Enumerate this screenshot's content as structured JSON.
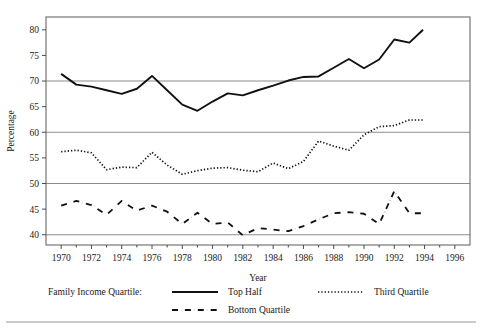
{
  "chart_data": {
    "type": "line",
    "title": "",
    "xlabel": "Year",
    "ylabel": "Percentage",
    "xlim": [
      1969,
      1997
    ],
    "ylim": [
      38,
      82.5
    ],
    "xticks": [
      1970,
      1972,
      1974,
      1976,
      1978,
      1980,
      1982,
      1984,
      1986,
      1988,
      1990,
      1992,
      1994,
      1996
    ],
    "xtick_labels": [
      "1970",
      "1972",
      "1974",
      "1976",
      "1978",
      "1980",
      "1982",
      "1984",
      "1986",
      "1988",
      "1990",
      "1992",
      "1994",
      "1996"
    ],
    "xminor_ticks": [
      1971,
      1973,
      1975,
      1977,
      1979,
      1981,
      1983,
      1985,
      1987,
      1989,
      1991,
      1993,
      1995
    ],
    "yticks": [
      40,
      45,
      50,
      55,
      60,
      65,
      70,
      75,
      80
    ],
    "ytick_labels": [
      "40",
      "45",
      "50",
      "55",
      "60",
      "65",
      "70",
      "75",
      "80"
    ],
    "gridlines_y": [
      40,
      50,
      60,
      70
    ],
    "grid": true,
    "legend_position": "below-axis",
    "legend_title": "Family Income Quartile:",
    "x": [
      1970,
      1971,
      1972,
      1973,
      1974,
      1975,
      1976,
      1977,
      1978,
      1979,
      1980,
      1981,
      1982,
      1983,
      1984,
      1985,
      1986,
      1987,
      1988,
      1989,
      1990,
      1991,
      1992,
      1993
    ],
    "series": [
      {
        "name": "Top Half",
        "style": "solid",
        "color": "#111111",
        "width": 1.9,
        "values": [
          71.4,
          69.3,
          68.9,
          68.2,
          67.5,
          68.5,
          71.0,
          68.2,
          65.4,
          64.2,
          66.0,
          67.6,
          67.2,
          68.2,
          69.1,
          70.1,
          70.8,
          70.9,
          72.6,
          74.3,
          72.5,
          74.2,
          78.1,
          77.5
        ]
      },
      {
        "name": "Third Quartile",
        "style": "dotted",
        "color": "#111111",
        "width": 1.7,
        "values": [
          56.2,
          56.5,
          56.0,
          52.7,
          53.2,
          53.1,
          56.1,
          53.6,
          51.8,
          52.5,
          53.0,
          53.1,
          52.6,
          52.3,
          54.0,
          52.9,
          54.3,
          58.3,
          57.3,
          56.5,
          59.5,
          61.1,
          61.3,
          62.4
        ]
      },
      {
        "name": "Bottom Quartile",
        "style": "dashed",
        "color": "#111111",
        "width": 1.8,
        "values": [
          45.7,
          46.6,
          45.8,
          43.9,
          46.6,
          44.7,
          45.7,
          44.5,
          42.1,
          44.3,
          42.1,
          42.4,
          39.9,
          41.3,
          41.0,
          40.7,
          41.7,
          43.0,
          44.2,
          44.4,
          44.1,
          42.1,
          48.5,
          44.2
        ]
      }
    ],
    "series_last_points": {
      "Top Half": 80.0,
      "Third Quartile": 62.4,
      "Bottom Quartile": 44.2
    }
  },
  "legend": {
    "title": "Family Income Quartile:",
    "entries": [
      {
        "label": "Top Half",
        "style": "solid"
      },
      {
        "label": "Third Quartile",
        "style": "dotted"
      },
      {
        "label": "Bottom Quartile",
        "style": "dashed"
      }
    ]
  }
}
